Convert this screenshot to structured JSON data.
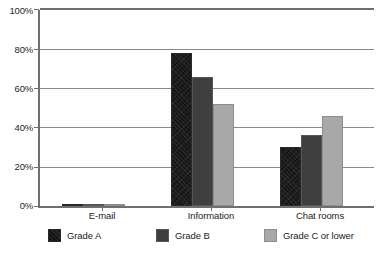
{
  "chart_data": {
    "type": "bar",
    "title": "",
    "subtitle": "",
    "xlabel": "",
    "ylabel": "",
    "categories": [
      "E-mail",
      "Information",
      "Chat rooms"
    ],
    "series": [
      {
        "name": "Grade A",
        "color": "#161616",
        "values": [
          70,
          78,
          30
        ]
      },
      {
        "name": "Grade B",
        "color": "#3f3f3f",
        "values": [
          72,
          66,
          36
        ]
      },
      {
        "name": "Grade C or lower",
        "color": "#a8a8a8",
        "values": [
          54,
          52,
          46
        ]
      }
    ],
    "ylim": [
      0,
      100
    ],
    "yticks": [
      0,
      20,
      40,
      60,
      80,
      100
    ],
    "ytick_labels": [
      "0%",
      "20%",
      "40%",
      "60%",
      "80%",
      "100%"
    ],
    "grid": true,
    "grid_axis": "y",
    "legend_position": "bottom",
    "value_unit": "%"
  },
  "legend": {
    "entries": [
      {
        "label": "Grade A",
        "swatch": "legend-swatch-grade-a"
      },
      {
        "label": "Grade B",
        "swatch": "legend-swatch-grade-b"
      },
      {
        "label": "Grade C or lower",
        "swatch": "legend-swatch-grade-c-or-lower"
      }
    ]
  },
  "axes": {
    "y": {
      "labels": [
        "100%",
        "80%",
        "60%",
        "40%",
        "20%",
        "0%"
      ]
    },
    "x": {
      "labels": [
        "E-mail",
        "Information",
        "Chat rooms"
      ]
    }
  }
}
